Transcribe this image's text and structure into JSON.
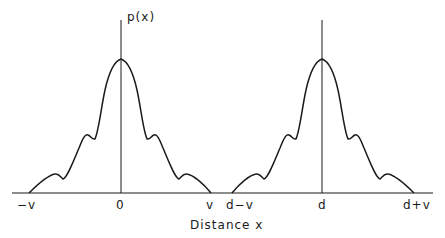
{
  "diagram": {
    "y_axis_label": "p(x)",
    "x_axis_title": "Distance x",
    "tick_labels": [
      {
        "text": "−v",
        "x": 25
      },
      {
        "text": "0",
        "x": 120
      },
      {
        "text": "v",
        "x": 210
      },
      {
        "text": "d−v",
        "x": 238
      },
      {
        "text": "d",
        "x": 322
      },
      {
        "text": "d+v",
        "x": 418
      }
    ],
    "colors": {
      "line": "#1a1a1a",
      "background": "#ffffff"
    },
    "distributions": [
      {
        "name": "centered-at-0",
        "center": "0",
        "support": [
          "−v",
          "v"
        ]
      },
      {
        "name": "centered-at-d",
        "center": "d",
        "support": [
          "d−v",
          "d+v"
        ]
      }
    ]
  }
}
